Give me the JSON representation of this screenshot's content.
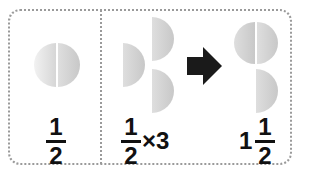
{
  "panels": [
    {
      "id": "half",
      "label": {
        "numerator": "1",
        "denominator": "2"
      },
      "pieces": "one circle split into two halves"
    },
    {
      "id": "half-times-three",
      "label": {
        "numerator": "1",
        "denominator": "2",
        "operator": "×",
        "multiplier": "3"
      },
      "pieces": "three half circles"
    },
    {
      "id": "result",
      "label": {
        "whole": "1",
        "numerator": "1",
        "denominator": "2"
      },
      "pieces": "one full circle plus one half circle"
    }
  ],
  "arrow": {
    "icon": "right-arrow-icon",
    "color": "#1a1a1a"
  },
  "colors": {
    "piece_light": "#e4e4e4",
    "piece_mid": "#cfcfcf",
    "border": "#9a9a9a",
    "text": "#111111"
  }
}
